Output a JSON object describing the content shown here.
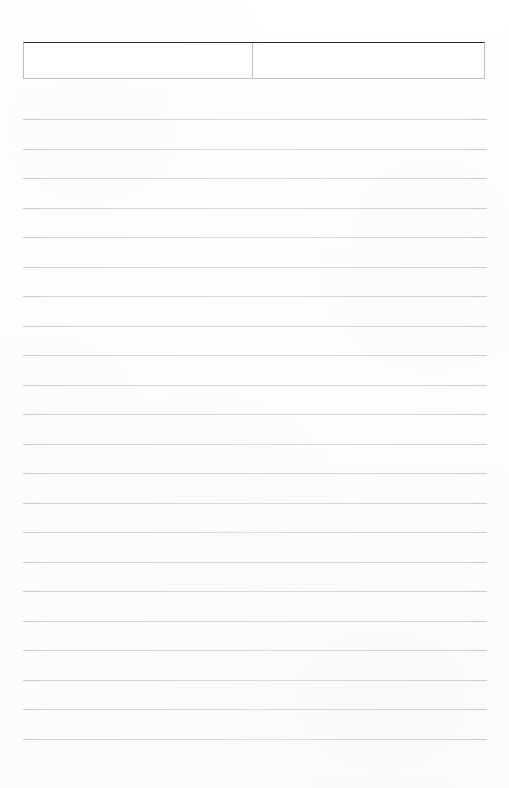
{
  "document": {
    "type": "blank-lined-form-page",
    "orientation": "portrait",
    "page_background_color": "#fdfdfd",
    "content_text": ""
  },
  "header_box": {
    "name": "two-cell-header-box",
    "top_border_color": "#2e2e2e",
    "side_border_color": "#b9bcc0",
    "cells": [
      {
        "id": "left",
        "text": "",
        "placeholder": ""
      },
      {
        "id": "right",
        "text": "",
        "placeholder": ""
      }
    ]
  },
  "ruled_area": {
    "line_color": "#d0d3d7",
    "line_count": 22,
    "first_line_y": 119,
    "line_spacing": 29.5,
    "left_margin": 23,
    "right_margin": 487,
    "lines": [
      {
        "index": 1,
        "y": 119,
        "text": ""
      },
      {
        "index": 2,
        "y": 149,
        "text": ""
      },
      {
        "index": 3,
        "y": 178,
        "text": ""
      },
      {
        "index": 4,
        "y": 208,
        "text": ""
      },
      {
        "index": 5,
        "y": 237,
        "text": ""
      },
      {
        "index": 6,
        "y": 267,
        "text": ""
      },
      {
        "index": 7,
        "y": 296,
        "text": ""
      },
      {
        "index": 8,
        "y": 326,
        "text": ""
      },
      {
        "index": 9,
        "y": 355,
        "text": ""
      },
      {
        "index": 10,
        "y": 385,
        "text": ""
      },
      {
        "index": 11,
        "y": 414,
        "text": ""
      },
      {
        "index": 12,
        "y": 444,
        "text": ""
      },
      {
        "index": 13,
        "y": 473,
        "text": ""
      },
      {
        "index": 14,
        "y": 503,
        "text": ""
      },
      {
        "index": 15,
        "y": 532,
        "text": ""
      },
      {
        "index": 16,
        "y": 562,
        "text": ""
      },
      {
        "index": 17,
        "y": 591,
        "text": ""
      },
      {
        "index": 18,
        "y": 621,
        "text": ""
      },
      {
        "index": 19,
        "y": 650,
        "text": ""
      },
      {
        "index": 20,
        "y": 680,
        "text": ""
      },
      {
        "index": 21,
        "y": 709,
        "text": ""
      },
      {
        "index": 22,
        "y": 739,
        "text": ""
      }
    ]
  }
}
